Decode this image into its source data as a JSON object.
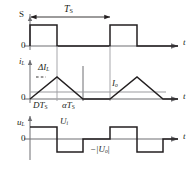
{
  "figure": {
    "kind": "waveform-timing-diagram",
    "line_color": "#231f20",
    "axis_color": "#6e6e72",
    "background": "#ffffff"
  },
  "panels": [
    {
      "id": "switch",
      "y_label": "S",
      "zero_label": "0",
      "time_label": "t",
      "period_label": "T",
      "period_sub": "S",
      "waveform": {
        "type": "square-pulse-train",
        "levels": [
          0,
          1
        ],
        "duty_cycle": 0.33,
        "period_units": 1.0,
        "pulses": [
          {
            "start": 0.0,
            "end": 0.33
          },
          {
            "start": 1.0,
            "end": 1.33
          }
        ]
      }
    },
    {
      "id": "inductor-current",
      "y_label": "i",
      "y_sub": "L",
      "zero_label": "0",
      "time_label": "t",
      "ripple_label": "ΔI",
      "ripple_sub": "L",
      "average_label": "I",
      "average_sub": "o",
      "on_time_label": "DT",
      "on_time_sub": "S",
      "fall_time_label": "αT",
      "fall_time_sub": "S",
      "waveform": {
        "type": "triangular-discontinuous",
        "rise_end": 0.33,
        "fall_end": 0.66,
        "peak_value": 1.0,
        "valley_value": 0.0,
        "dead_time_until": 1.0
      }
    },
    {
      "id": "inductor-voltage",
      "y_label": "u",
      "y_sub": "L",
      "zero_label": "0",
      "time_label": "t",
      "positive_level_label": "U",
      "positive_level_sub": "i",
      "negative_level_label": "−|U",
      "negative_level_sub": "o",
      "negative_level_tail": "|",
      "waveform": {
        "type": "bipolar-square",
        "segments": [
          {
            "start": 0.0,
            "end": 0.33,
            "level": 1
          },
          {
            "start": 0.33,
            "end": 0.66,
            "level": -1
          },
          {
            "start": 0.66,
            "end": 1.0,
            "level": 0
          },
          {
            "start": 1.0,
            "end": 1.33,
            "level": 1
          },
          {
            "start": 1.33,
            "end": 1.66,
            "level": -1
          },
          {
            "start": 1.66,
            "end": 2.0,
            "level": 0
          }
        ]
      }
    }
  ]
}
